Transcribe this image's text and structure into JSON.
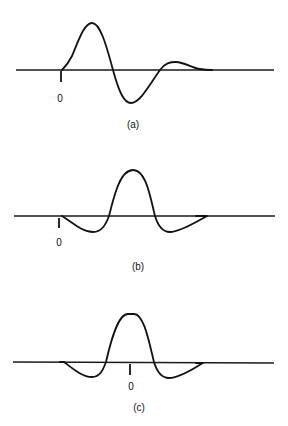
{
  "panels": [
    {
      "caption": "(a)",
      "origin_label": "0",
      "description": "Damped oscillating pulse starting at origin: positive lobe, larger negative lobe, small positive tail"
    },
    {
      "caption": "(b)",
      "origin_label": "0",
      "description": "Symmetric pulse with central positive peak and two negative side lobes, origin at left start"
    },
    {
      "caption": "(c)",
      "origin_label": "0",
      "description": "Same symmetric pulse as (b) with origin at the center of the peak"
    }
  ],
  "colors": {
    "line": "#111111",
    "background": "#ffffff"
  }
}
